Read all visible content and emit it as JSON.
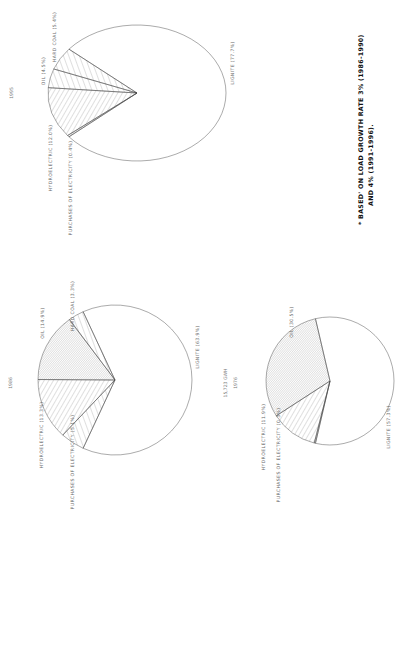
{
  "footnote": {
    "line1": "*  BASED' ON LOAD  GROWTH  RATE  3% (1986-1990)",
    "line2": "AND  4% (1991-1996)."
  },
  "chart_data": [
    {
      "type": "pie",
      "title": "1995",
      "slices": [
        {
          "name": "LIGNITE",
          "value": 77.7,
          "label": "LIGNITE (77.7%)",
          "hatch": "none"
        },
        {
          "name": "HARD COAL",
          "value": 5.4,
          "label": "HARD COAL (5.4%)",
          "hatch": "sparse"
        },
        {
          "name": "OIL",
          "value": 4.5,
          "label": "OIL (4.5%)",
          "hatch": "sparse"
        },
        {
          "name": "HYDROELECTRIC",
          "value": 12.0,
          "label": "HYDROELECTRIC (12.0%)",
          "hatch": "medium"
        },
        {
          "name": "PURCHASES OF ELECTRICITY",
          "value": 0.4,
          "label": "PURCHASES OF ELECTRICITY (0.4%)",
          "hatch": "dense"
        }
      ]
    },
    {
      "type": "pie",
      "title": "1986",
      "slices": [
        {
          "name": "LIGNITE",
          "value": 63.9,
          "label": "LIGNITE (63.9%)",
          "hatch": "none"
        },
        {
          "name": "HARD COAL",
          "value": 3.3,
          "label": "HARD COAL (3.3%)",
          "hatch": "sparse"
        },
        {
          "name": "OIL",
          "value": 14.9,
          "label": "OIL (14.9%)",
          "hatch": "dense"
        },
        {
          "name": "HYDROELECTRIC",
          "value": 13.3,
          "label": "HYDROELECTRIC (13.3%)",
          "hatch": "medium"
        },
        {
          "name": "PURCHASES OF ELECTRICITY",
          "value": 5.1,
          "label": "PURCHASES OF ELECTRICITY (5.1%)",
          "hatch": "sparse"
        }
      ]
    },
    {
      "type": "pie",
      "title": "1976",
      "subtitle": "15,723 GWH",
      "slices": [
        {
          "name": "LIGNITE",
          "value": 57.3,
          "label": "LIGNITE (57.3%)",
          "hatch": "none"
        },
        {
          "name": "OIL",
          "value": 30.5,
          "label": "OIL (30.5%)",
          "hatch": "dense"
        },
        {
          "name": "HYDROELECTRIC",
          "value": 11.9,
          "label": "HYDROELECTRIC (11.9%)",
          "hatch": "medium"
        },
        {
          "name": "PURCHASES OF ELECTRICITY",
          "value": 0.3,
          "label": "PURCHASES OF ELECTRICITY (0.3%)",
          "hatch": "dense"
        }
      ]
    }
  ]
}
